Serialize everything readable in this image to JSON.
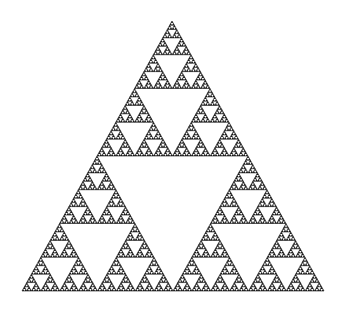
{
  "figure": {
    "type": "fractal",
    "background": "#ffffff",
    "stroke": "#1a1a1a",
    "fill": "#ffffff",
    "depth": 6,
    "vertices": {
      "apex": [
        172,
        21
      ],
      "bottom_left": [
        22,
        291
      ],
      "bottom_right": [
        324,
        291
      ]
    }
  }
}
